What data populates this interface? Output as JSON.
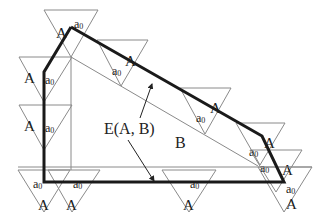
{
  "diagram": {
    "colors": {
      "thick_edge": "#1a1a1a",
      "thin_line": "#8a8a8a",
      "background": "#ffffff"
    },
    "labels": {
      "region": "B",
      "edge_set": "E(A, B)",
      "triangle": "A",
      "ref_point": "a",
      "ref_subscript": "0"
    },
    "polygon_B": [
      [
        71,
        27
      ],
      [
        44,
        72
      ],
      [
        44,
        182
      ],
      [
        284,
        182
      ],
      [
        262,
        136
      ],
      [
        71,
        27
      ]
    ],
    "triangles": [
      {
        "top_left": [
          44,
          10
        ],
        "top_right": [
          98,
          10
        ],
        "apex": [
          71,
          57
        ],
        "A_pos": [
          56,
          28
        ],
        "a_pos": [
          74,
          20
        ]
      },
      {
        "top_left": [
          19,
          57
        ],
        "top_right": [
          72,
          57
        ],
        "apex": [
          44,
          102
        ],
        "A_pos": [
          24,
          73
        ],
        "a_pos": [
          45,
          76
        ]
      },
      {
        "top_left": [
          19,
          105
        ],
        "top_right": [
          72,
          105
        ],
        "apex": [
          44,
          150
        ],
        "A_pos": [
          24,
          121
        ],
        "a_pos": [
          45,
          124
        ]
      },
      {
        "top_left": [
          18,
          170
        ],
        "top_right": [
          70,
          170
        ],
        "apex": [
          44,
          212
        ],
        "A_pos": [
          38,
          200
        ],
        "a_pos": [
          33,
          180
        ]
      },
      {
        "top_left": [
          48,
          170
        ],
        "top_right": [
          100,
          170
        ],
        "apex": [
          72,
          212
        ],
        "A_pos": [
          66,
          200
        ],
        "a_pos": [
          73,
          180
        ]
      },
      {
        "top_left": [
          162,
          170
        ],
        "top_right": [
          216,
          170
        ],
        "apex": [
          189,
          212
        ],
        "A_pos": [
          183,
          200
        ],
        "a_pos": [
          190,
          180
        ]
      },
      {
        "top_left": [
          97,
          40
        ],
        "top_right": [
          148,
          40
        ],
        "apex": [
          121,
          86
        ],
        "A_pos": [
          125,
          56
        ],
        "a_pos": [
          112,
          67
        ]
      },
      {
        "top_left": [
          180,
          88
        ],
        "top_right": [
          231,
          88
        ],
        "apex": [
          205,
          134
        ],
        "A_pos": [
          210,
          103
        ],
        "a_pos": [
          196,
          114
        ]
      },
      {
        "top_left": [
          236,
          123
        ],
        "top_right": [
          285,
          123
        ],
        "apex": [
          260,
          165
        ],
        "A_pos": [
          264,
          138
        ],
        "a_pos": [
          249,
          148
        ]
      },
      {
        "top_left": [
          250,
          150
        ],
        "top_right": [
          302,
          150
        ],
        "apex": [
          276,
          192
        ],
        "A_pos": [
          282,
          165
        ],
        "a_pos": [
          260,
          164
        ]
      },
      {
        "top_left": [
          258,
          167
        ],
        "top_right": [
          312,
          167
        ],
        "apex": [
          284,
          212
        ],
        "A_pos": [
          286,
          199
        ],
        "a_pos": [
          286,
          185
        ]
      }
    ],
    "thin_lines": [
      {
        "from": [
          71,
          57
        ],
        "to": [
          71,
          170
        ]
      },
      {
        "from": [
          71,
          57
        ],
        "to": [
          258,
          166
        ]
      },
      {
        "from": [
          18,
          167
        ],
        "to": [
          312,
          167
        ]
      }
    ],
    "leaders": [
      {
        "from": [
          140,
          118
        ],
        "to": [
          152,
          84
        ]
      },
      {
        "from": [
          128,
          140
        ],
        "to": [
          154,
          181
        ]
      }
    ],
    "label_positions": {
      "edge_set": [
        104,
        134
      ],
      "region": [
        175,
        148
      ]
    }
  }
}
